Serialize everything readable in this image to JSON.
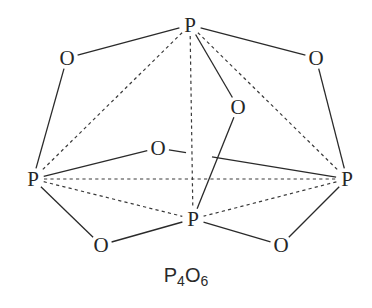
{
  "title": "P4O6",
  "formula": {
    "element1": "P",
    "count1": "4",
    "element2": "O",
    "count2": "6"
  },
  "atoms": [
    {
      "id": "P1",
      "symbol": "P",
      "x": 190,
      "y": 25
    },
    {
      "id": "P2",
      "symbol": "P",
      "x": 33,
      "y": 179
    },
    {
      "id": "P3",
      "symbol": "P",
      "x": 347,
      "y": 179
    },
    {
      "id": "P4",
      "symbol": "P",
      "x": 193,
      "y": 219
    },
    {
      "id": "O1",
      "symbol": "O",
      "x": 67,
      "y": 58
    },
    {
      "id": "O2",
      "symbol": "O",
      "x": 316,
      "y": 58
    },
    {
      "id": "O3",
      "symbol": "O",
      "x": 238,
      "y": 107
    },
    {
      "id": "O4",
      "symbol": "O",
      "x": 158,
      "y": 148
    },
    {
      "id": "O5",
      "symbol": "O",
      "x": 101,
      "y": 245
    },
    {
      "id": "O6",
      "symbol": "O",
      "x": 281,
      "y": 245
    }
  ],
  "bonds_solid": [
    [
      "P1",
      "O1"
    ],
    [
      "P1",
      "O2"
    ],
    [
      "P1",
      "O3"
    ],
    [
      "O1",
      "P2"
    ],
    [
      "O2",
      "P3"
    ],
    [
      "O3",
      "P4"
    ],
    [
      "P2",
      "O4"
    ],
    [
      "O4",
      "P3"
    ],
    [
      "P2",
      "O5"
    ],
    [
      "O5",
      "P4"
    ],
    [
      "P4",
      "O6"
    ],
    [
      "O6",
      "P3"
    ]
  ],
  "edges_dashed": [
    [
      "P1",
      "P2"
    ],
    [
      "P1",
      "P3"
    ],
    [
      "P1",
      "P4"
    ],
    [
      "P2",
      "P3"
    ],
    [
      "P2",
      "P4"
    ],
    [
      "P3",
      "P4"
    ]
  ]
}
